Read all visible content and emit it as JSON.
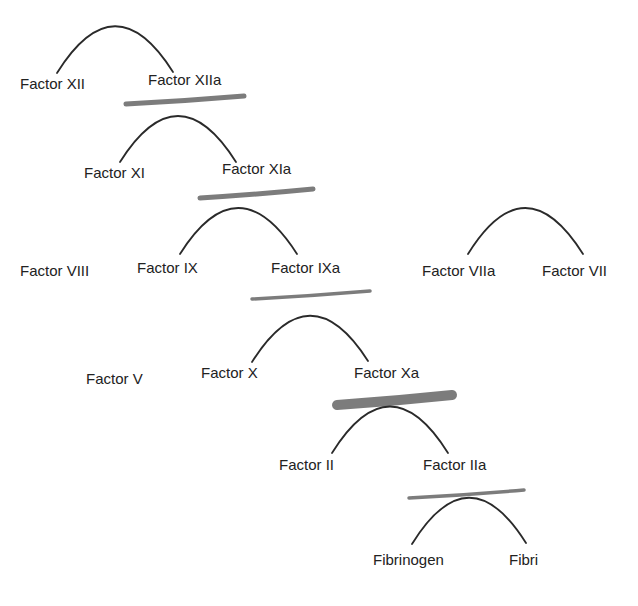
{
  "diagram": {
    "colors": {
      "text": "#222222",
      "arc": "#2a2a2a",
      "highlight": "#6e6e6e"
    },
    "labels": [
      {
        "id": "factor-xii",
        "text": "Factor XII",
        "x": 20,
        "y": 89
      },
      {
        "id": "factor-xiia",
        "text": "Factor XIIa",
        "x": 148,
        "y": 85
      },
      {
        "id": "factor-xi",
        "text": "Factor XI",
        "x": 84,
        "y": 178
      },
      {
        "id": "factor-xia",
        "text": "Factor XIa",
        "x": 222,
        "y": 174
      },
      {
        "id": "factor-viii",
        "text": "Factor VIII",
        "x": 20,
        "y": 276
      },
      {
        "id": "factor-ix",
        "text": "Factor IX",
        "x": 137,
        "y": 273
      },
      {
        "id": "factor-ixa",
        "text": "Factor IXa",
        "x": 271,
        "y": 273
      },
      {
        "id": "factor-viia",
        "text": "Factor VIIa",
        "x": 422,
        "y": 276
      },
      {
        "id": "factor-vii",
        "text": "Factor VII",
        "x": 542,
        "y": 276
      },
      {
        "id": "factor-v",
        "text": "Factor V",
        "x": 86,
        "y": 384
      },
      {
        "id": "factor-x",
        "text": "Factor X",
        "x": 201,
        "y": 378
      },
      {
        "id": "factor-xa",
        "text": "Factor Xa",
        "x": 354,
        "y": 378
      },
      {
        "id": "factor-ii",
        "text": "Factor II",
        "x": 279,
        "y": 470
      },
      {
        "id": "factor-iia",
        "text": "Factor IIa",
        "x": 423,
        "y": 470
      },
      {
        "id": "fibrinogen",
        "text": "Fibrinogen",
        "x": 373,
        "y": 565
      },
      {
        "id": "fibrin",
        "text": "Fibri",
        "x": 509,
        "y": 565
      }
    ],
    "arcs": [
      {
        "from": "factor-xii",
        "to": "factor-xiia",
        "x1": 57,
        "y1": 73,
        "cx": 115,
        "cy": -20,
        "x2": 173,
        "y2": 72
      },
      {
        "from": "factor-xi",
        "to": "factor-xia",
        "x1": 120,
        "y1": 162,
        "cx": 178,
        "cy": 70,
        "x2": 236,
        "y2": 162
      },
      {
        "from": "factor-ix",
        "to": "factor-ixa",
        "x1": 180,
        "y1": 254,
        "cx": 238,
        "cy": 162,
        "x2": 297,
        "y2": 254
      },
      {
        "from": "factor-viia",
        "to": "factor-vii",
        "x1": 468,
        "y1": 254,
        "cx": 525,
        "cy": 162,
        "x2": 583,
        "y2": 254
      },
      {
        "from": "factor-x",
        "to": "factor-xa",
        "x1": 252,
        "y1": 362,
        "cx": 310,
        "cy": 270,
        "x2": 368,
        "y2": 361
      },
      {
        "from": "factor-ii",
        "to": "factor-iia",
        "x1": 332,
        "y1": 453,
        "cx": 390,
        "cy": 360,
        "x2": 448,
        "y2": 453
      },
      {
        "from": "fibrinogen",
        "to": "fibrin",
        "x1": 412,
        "y1": 544,
        "cx": 469,
        "cy": 452,
        "x2": 526,
        "y2": 543
      }
    ],
    "highlights": [
      {
        "under": "factor-xiia",
        "x1": 126,
        "y1": 104,
        "x2": 244,
        "y2": 96,
        "width": 5
      },
      {
        "under": "factor-xia",
        "x1": 200,
        "y1": 198,
        "x2": 313,
        "y2": 189,
        "width": 5
      },
      {
        "under": "factor-ixa",
        "x1": 252,
        "y1": 299,
        "x2": 370,
        "y2": 291,
        "width": 3.5
      },
      {
        "under": "factor-xa",
        "x1": 337,
        "y1": 405,
        "x2": 452,
        "y2": 395,
        "width": 10
      },
      {
        "under": "factor-iia",
        "x1": 409,
        "y1": 498,
        "x2": 524,
        "y2": 490,
        "width": 3.5
      }
    ]
  }
}
